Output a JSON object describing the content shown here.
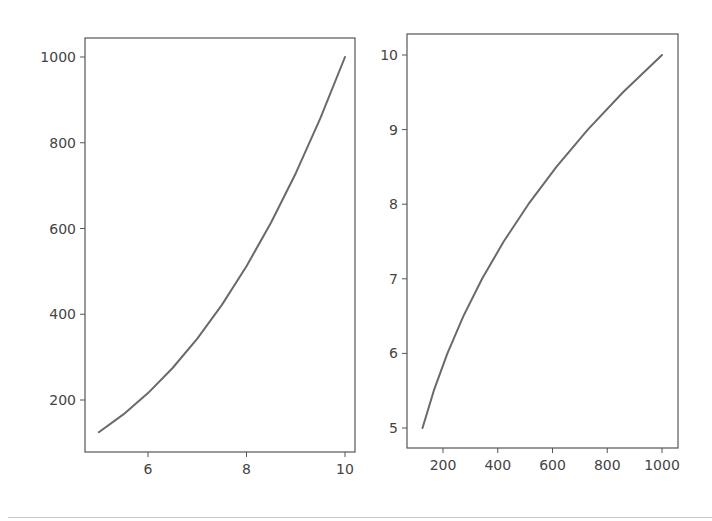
{
  "chart_data": [
    {
      "type": "line",
      "title": "",
      "xlabel": "",
      "ylabel": "",
      "grid": false,
      "xlim": [
        4.75,
        10.25
      ],
      "ylim": [
        81,
        1044
      ],
      "xticks": [
        6,
        8,
        10
      ],
      "xtick_labels": [
        "6",
        "8",
        "10"
      ],
      "yticks": [
        200,
        400,
        600,
        800,
        1000
      ],
      "ytick_labels": [
        "200",
        "400",
        "600",
        "800",
        "1000"
      ],
      "series": [
        {
          "name": "y = x^3",
          "color": "#6a6a6a",
          "x": [
            5.0,
            5.5,
            6.0,
            6.5,
            7.0,
            7.5,
            8.0,
            8.5,
            9.0,
            9.5,
            10.0
          ],
          "y": [
            125,
            166.4,
            216,
            274.6,
            343,
            421.9,
            512,
            614.1,
            729,
            857.4,
            1000
          ]
        }
      ]
    },
    {
      "type": "line",
      "title": "",
      "xlabel": "",
      "ylabel": "",
      "grid": false,
      "xlim": [
        81,
        1044
      ],
      "ylim": [
        4.75,
        10.25
      ],
      "xticks": [
        200,
        400,
        600,
        800,
        1000
      ],
      "xtick_labels": [
        "200",
        "400",
        "600",
        "800",
        "1000"
      ],
      "yticks": [
        5,
        6,
        7,
        8,
        9,
        10
      ],
      "ytick_labels": [
        "5",
        "6",
        "7",
        "8",
        "9",
        "10"
      ],
      "series": [
        {
          "name": "x = y^3",
          "color": "#6a6a6a",
          "x": [
            125,
            166.4,
            216,
            274.6,
            343,
            421.9,
            512,
            614.1,
            729,
            857.4,
            1000
          ],
          "y": [
            5.0,
            5.5,
            6.0,
            6.5,
            7.0,
            7.5,
            8.0,
            8.5,
            9.0,
            9.5,
            10.0
          ]
        }
      ]
    }
  ],
  "panels": [
    {
      "frame": {
        "left": 85,
        "top": 38,
        "right": 355,
        "bottom": 452
      },
      "x_map": {
        "v0": 6,
        "p0": 148,
        "v1": 10,
        "p1": 345
      },
      "y_map": {
        "v0": 200,
        "p0": 400,
        "v1": 1000,
        "p1": 57
      }
    },
    {
      "frame": {
        "left": 407,
        "top": 34,
        "right": 678,
        "bottom": 448
      },
      "x_map": {
        "v0": 200,
        "p0": 443,
        "v1": 1000,
        "p1": 662
      },
      "y_map": {
        "v0": 5,
        "p0": 428,
        "v1": 10,
        "p1": 55
      }
    }
  ]
}
